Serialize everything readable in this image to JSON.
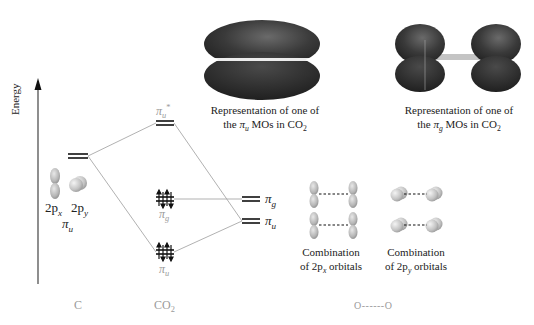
{
  "axis": {
    "label": "Energy"
  },
  "carbon": {
    "column_label": "C",
    "orbital_labels": [
      "2p",
      "2p"
    ],
    "orbital_subscripts": [
      "x",
      "y"
    ],
    "symmetry_label": "π",
    "symmetry_subscript": "u"
  },
  "co2": {
    "column_label": "CO",
    "column_subscript": "2",
    "levels": [
      {
        "id": "pi_u_star",
        "label": "π",
        "subscript": "u",
        "superscript": "*",
        "electrons": 0
      },
      {
        "id": "pi_g",
        "label": "π",
        "subscript": "g",
        "electrons": 4
      },
      {
        "id": "pi_u",
        "label": "π",
        "subscript": "u",
        "electrons": 4
      }
    ]
  },
  "oxygen_group": {
    "levels": [
      {
        "id": "pi_g",
        "label": "π",
        "subscript": "g"
      },
      {
        "id": "pi_u",
        "label": "π",
        "subscript": "u"
      }
    ],
    "column_label": "O------O"
  },
  "mo_pictures": [
    {
      "caption_line1": "Representation of one of",
      "caption_pre": "the ",
      "caption_symbol": "π",
      "caption_sub": "u",
      "caption_post": " MOs in CO",
      "caption_post_sub": "2"
    },
    {
      "caption_line1": "Representation of one of",
      "caption_pre": "the ",
      "caption_symbol": "π",
      "caption_sub": "g",
      "caption_post": " MOs in CO",
      "caption_post_sub": "2"
    }
  ],
  "combinations": [
    {
      "line1": "Combination",
      "line2_pre": "of 2p",
      "line2_sub": "x",
      "line2_post": " orbitals"
    },
    {
      "line1": "Combination",
      "line2_pre": "of 2p",
      "line2_sub": "y",
      "line2_post": " orbitals"
    }
  ],
  "colors": {
    "lobe_dark": "#2b2b2b",
    "lobe_mid": "#555555",
    "correlation_line": "#a8a8a8",
    "level_line": "#111111",
    "gray_label": "#9a9a9a"
  }
}
